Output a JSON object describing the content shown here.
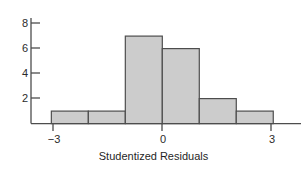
{
  "chart_data": {
    "type": "bar",
    "title": "",
    "subtitle": "",
    "xlabel": "Studentized Residuals",
    "ylabel": "",
    "categories": [
      "-3 to -2",
      "-2 to -1",
      "-1 to 0",
      "0 to 1",
      "1 to 2",
      "2 to 3"
    ],
    "bin_edges": [
      -3,
      -2,
      -1,
      0,
      1,
      2,
      3
    ],
    "values": [
      1,
      1,
      7,
      6,
      2,
      1
    ],
    "xlim": [
      -3.55,
      3.75
    ],
    "ylim": [
      0,
      8.8
    ],
    "xticks": [
      -3,
      0,
      3
    ],
    "xticklabels": [
      "−3",
      "0",
      "3"
    ],
    "yticks": [
      2,
      4,
      6,
      8
    ],
    "yticklabels": [
      "2",
      "4",
      "6",
      "8"
    ],
    "grid": false,
    "legend": false,
    "bar_fill_color": "#cccccc",
    "bar_edge_color": "#4d4d4d",
    "axis_color": "#4d4d4d",
    "text_color": "#2b2b2b",
    "background_color": "#ffffff"
  },
  "axes": {
    "x_axis_label": "Studentized Residuals"
  }
}
